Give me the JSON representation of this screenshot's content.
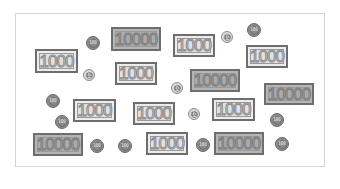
{
  "scene": {
    "frame": {
      "x": 15,
      "y": 13,
      "width": 310,
      "height": 154
    },
    "bills": [
      {
        "value": "1000",
        "x": 35,
        "y": 49,
        "w": 43,
        "h": 24
      },
      {
        "value": "10000",
        "x": 111,
        "y": 27,
        "w": 50,
        "h": 24
      },
      {
        "value": "1000",
        "x": 115,
        "y": 62,
        "w": 42,
        "h": 23
      },
      {
        "value": "1000",
        "x": 173,
        "y": 34,
        "w": 42,
        "h": 23
      },
      {
        "value": "1000",
        "x": 246,
        "y": 45,
        "w": 42,
        "h": 23
      },
      {
        "value": "10000",
        "x": 190,
        "y": 69,
        "w": 50,
        "h": 23
      },
      {
        "value": "10000",
        "x": 264,
        "y": 83,
        "w": 50,
        "h": 22
      },
      {
        "value": "1000",
        "x": 73,
        "y": 99,
        "w": 43,
        "h": 23
      },
      {
        "value": "1000",
        "x": 133,
        "y": 102,
        "w": 42,
        "h": 23
      },
      {
        "value": "1000",
        "x": 212,
        "y": 98,
        "w": 43,
        "h": 23
      },
      {
        "value": "10000",
        "x": 33,
        "y": 133,
        "w": 50,
        "h": 23
      },
      {
        "value": "1000",
        "x": 146,
        "y": 132,
        "w": 42,
        "h": 23
      },
      {
        "value": "10000",
        "x": 214,
        "y": 132,
        "w": 50,
        "h": 23
      }
    ],
    "coins": [
      {
        "value": "100",
        "cx": 93,
        "cy": 43,
        "r": 7
      },
      {
        "value": "10",
        "cx": 89,
        "cy": 75,
        "r": 6
      },
      {
        "value": "10",
        "cx": 227,
        "cy": 37,
        "r": 6
      },
      {
        "value": "100",
        "cx": 254,
        "cy": 30,
        "r": 7
      },
      {
        "value": "10",
        "cx": 177,
        "cy": 88,
        "r": 6
      },
      {
        "value": "100",
        "cx": 53,
        "cy": 101,
        "r": 7
      },
      {
        "value": "100",
        "cx": 62,
        "cy": 122,
        "r": 7
      },
      {
        "value": "10",
        "cx": 194,
        "cy": 114,
        "r": 6
      },
      {
        "value": "100",
        "cx": 277,
        "cy": 120,
        "r": 7
      },
      {
        "value": "100",
        "cx": 97,
        "cy": 146,
        "r": 7
      },
      {
        "value": "100",
        "cx": 125,
        "cy": 146,
        "r": 7
      },
      {
        "value": "100",
        "cx": 203,
        "cy": 145,
        "r": 7
      },
      {
        "value": "100",
        "cx": 282,
        "cy": 144,
        "r": 7
      }
    ],
    "colors": {
      "bill_1000_fill": "#ececec",
      "bill_10000_fill": "#b5b5b5",
      "bill_border": "#6e6e6e",
      "coin_10_fill": "#d9d9d9",
      "coin_100_fill": "#8a8a8a",
      "frame_border": "#d4d4d4"
    }
  }
}
